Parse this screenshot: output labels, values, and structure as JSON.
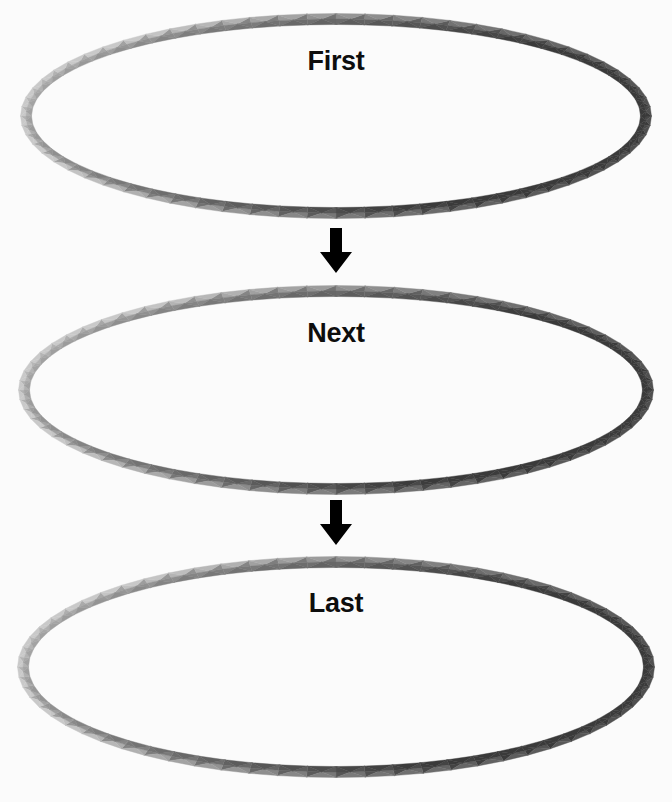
{
  "diagram": {
    "background_color": "#fbfbfb",
    "arrow_color": "#000000",
    "label_color": "#0d0d0d",
    "ring_highlight_color": "#c9c9c9",
    "ring_shadow_color": "#3a3a3a",
    "ring_midtone_color": "#7a7a7a",
    "stages": [
      {
        "label": "First",
        "ring_name": "faceted-ring",
        "cx": 336,
        "cy": 116,
        "rx": 310,
        "ry": 97,
        "band": 11,
        "label_x": 336,
        "label_y": 48
      },
      {
        "label": "Next",
        "ring_name": "faceted-ring",
        "cx": 336,
        "cy": 390,
        "rx": 312,
        "ry": 99,
        "band": 11,
        "label_x": 336,
        "label_y": 320
      },
      {
        "label": "Last",
        "ring_name": "faceted-ring",
        "cx": 336,
        "cy": 667,
        "rx": 313,
        "ry": 105,
        "band": 11,
        "label_x": 336,
        "label_y": 590
      }
    ],
    "connectors": [
      {
        "name": "arrow-first-to-next",
        "icon": "arrow-down-icon",
        "x": 336,
        "y": 228
      },
      {
        "name": "arrow-next-to-last",
        "icon": "arrow-down-icon",
        "x": 336,
        "y": 500
      }
    ],
    "facet_count": 68
  }
}
